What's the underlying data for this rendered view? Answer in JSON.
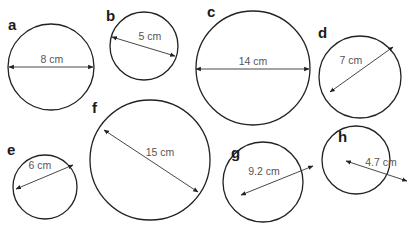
{
  "diagram": {
    "type": "circles-with-diameters",
    "circles": [
      {
        "id": "a",
        "label": "a",
        "measurement": "8 cm",
        "cx": 51,
        "cy": 67,
        "r": 43,
        "lx": 8,
        "ly": 30,
        "line": [
          9,
          67,
          93,
          67
        ],
        "tx": 52,
        "ty": 63
      },
      {
        "id": "b",
        "label": "b",
        "measurement": "5 cm",
        "cx": 144,
        "cy": 46,
        "r": 34,
        "lx": 106,
        "ly": 21,
        "line": [
          112,
          37,
          175,
          56
        ],
        "tx": 150,
        "ty": 40
      },
      {
        "id": "c",
        "label": "c",
        "measurement": "14 cm",
        "cx": 253,
        "cy": 68,
        "r": 57,
        "lx": 207,
        "ly": 17,
        "line": [
          196,
          69,
          309,
          69
        ],
        "tx": 253,
        "ty": 65
      },
      {
        "id": "d",
        "label": "d",
        "measurement": "7 cm",
        "cx": 360,
        "cy": 77,
        "r": 41,
        "lx": 318,
        "ly": 38,
        "line": [
          330,
          92,
          393,
          47
        ],
        "tx": 351,
        "ty": 64
      },
      {
        "id": "e",
        "label": "e",
        "measurement": "6 cm",
        "cx": 45,
        "cy": 187,
        "r": 32,
        "lx": 7,
        "ly": 155,
        "line": [
          16,
          189,
          73,
          165
        ],
        "tx": 40,
        "ty": 169
      },
      {
        "id": "f",
        "label": "f",
        "measurement": "15 cm",
        "cx": 150,
        "cy": 160,
        "r": 60,
        "lx": 92,
        "ly": 113,
        "line": [
          104,
          130,
          198,
          192
        ],
        "tx": 160,
        "ty": 156
      },
      {
        "id": "g",
        "label": "g",
        "measurement": "9.2 cm",
        "cx": 263,
        "cy": 182,
        "r": 40,
        "lx": 231,
        "ly": 158,
        "line": [
          241,
          195,
          313,
          166
        ],
        "tx": 264,
        "ty": 175
      },
      {
        "id": "h",
        "label": "h",
        "measurement": "4.7 cm",
        "cx": 356,
        "cy": 160,
        "r": 34,
        "lx": 338,
        "ly": 142,
        "line": [
          346,
          161,
          407,
          181
        ],
        "tx": 381,
        "ty": 166
      }
    ]
  }
}
